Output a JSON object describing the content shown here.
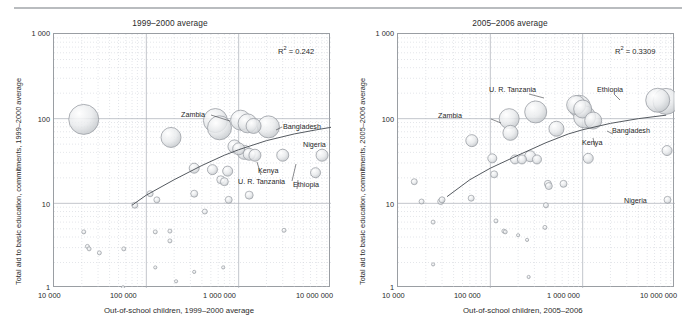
{
  "figure": {
    "top_rule_color": "#b9bcbf",
    "background": "#ffffff"
  },
  "panels": [
    {
      "id": "left",
      "title": "1999–2000 average",
      "ylabel": "Total aid to basic education, commitments, 1999–2000 average",
      "xlabel": "Out-of-school children, 1999–2000 average",
      "r2_prefix": "R",
      "r2_sup": "2",
      "r2_value": " = 0.242",
      "r2_text": "R2 = 0.242",
      "yticks": [
        "1 000",
        "100",
        "10",
        "1"
      ],
      "xticks": [
        "10 000",
        "100 000",
        "1 000 000",
        "10 000 000"
      ],
      "country_labels": [
        {
          "name": "Zambia",
          "text": "Zambia"
        },
        {
          "name": "Bangladesh",
          "text": "Bangladesh"
        },
        {
          "name": "Nigeria",
          "text": "Nigeria"
        },
        {
          "name": "Kenya",
          "text": "Kenya"
        },
        {
          "name": "U. R. Tanzania",
          "text": "U. R. Tanzania"
        },
        {
          "name": "Ethiopia",
          "text": "Ethiopia"
        }
      ]
    },
    {
      "id": "right",
      "title": "2005–2006 average",
      "ylabel": "Total aid to basic education, commitments, 2005–2006 average",
      "xlabel": "Out-of-school children, 2005–2006",
      "r2_prefix": "R",
      "r2_sup": "2",
      "r2_value": " = 0.3309",
      "r2_text": "R2 = 0.3309",
      "yticks": [
        "1 000",
        "100",
        "10",
        "1"
      ],
      "xticks": [
        "10 000",
        "100 000",
        "1 000 000",
        "10 000 000"
      ],
      "country_labels": [
        {
          "name": "U. R. Tanzania",
          "text": "U. R. Tanzania"
        },
        {
          "name": "Zambia",
          "text": "Zambia"
        },
        {
          "name": "Ethiopia",
          "text": "Ethiopia"
        },
        {
          "name": "Bangladesh",
          "text": "Bangladesh"
        },
        {
          "name": "Kenya",
          "text": "Kenya"
        },
        {
          "name": "Nigeria",
          "text": "Nigeria"
        }
      ]
    }
  ],
  "chart_data": [
    {
      "type": "scatter",
      "panel": "left",
      "title": "1999–2000 average",
      "xlabel": "Out-of-school children, 1999–2000 average",
      "ylabel": "Total aid to basic education, commitments, 1999–2000 average",
      "xscale": "log",
      "yscale": "log",
      "xlim": [
        10000,
        10000000
      ],
      "ylim": [
        1,
        1000
      ],
      "xticks": [
        10000,
        100000,
        1000000,
        10000000
      ],
      "yticks": [
        1,
        10,
        100,
        1000
      ],
      "grid": true,
      "minor_grid": true,
      "legend": "none",
      "annotations": [
        {
          "text": "R2 = 0.242",
          "x": 3000000,
          "y": 450
        }
      ],
      "trendline": {
        "kind": "log-fit",
        "x": [
          70000,
          100000,
          200000,
          400000,
          700000,
          1000000,
          2000000,
          4000000,
          7000000,
          10000000
        ],
        "y": [
          9.5,
          12.5,
          19,
          28,
          37,
          43,
          55,
          66,
          74,
          79
        ]
      },
      "bubble_size_meaning": "population / magnitude of out-of-school children (relative marker area)",
      "points": [
        {
          "label": "",
          "x": 21000,
          "y": 98,
          "size": 30
        },
        {
          "label": "",
          "x": 185000,
          "y": 60,
          "size": 20
        },
        {
          "label": "Zambia",
          "x": 560000,
          "y": 95,
          "size": 24
        },
        {
          "label": "",
          "x": 620000,
          "y": 78,
          "size": 24
        },
        {
          "label": "",
          "x": 1050000,
          "y": 96,
          "size": 20
        },
        {
          "label": "",
          "x": 1250000,
          "y": 88,
          "size": 19
        },
        {
          "label": "",
          "x": 1450000,
          "y": 82,
          "size": 15
        },
        {
          "label": "Bangladesh",
          "x": 2100000,
          "y": 80,
          "size": 22
        },
        {
          "label": "",
          "x": 900000,
          "y": 47,
          "size": 13
        },
        {
          "label": "",
          "x": 1000000,
          "y": 44,
          "size": 12
        },
        {
          "label": "",
          "x": 1150000,
          "y": 40,
          "size": 14
        },
        {
          "label": "",
          "x": 1300000,
          "y": 38,
          "size": 12
        },
        {
          "label": "Kenya",
          "x": 1500000,
          "y": 37,
          "size": 12
        },
        {
          "label": "U. R. Tanzania",
          "x": 3000000,
          "y": 37,
          "size": 12
        },
        {
          "label": "Nigeria",
          "x": 8000000,
          "y": 37,
          "size": 12
        },
        {
          "label": "Ethiopia",
          "x": 6800000,
          "y": 23,
          "size": 10
        },
        {
          "label": "",
          "x": 330000,
          "y": 26,
          "size": 10
        },
        {
          "label": "",
          "x": 520000,
          "y": 25,
          "size": 10
        },
        {
          "label": "",
          "x": 760000,
          "y": 24,
          "size": 10
        },
        {
          "label": "",
          "x": 640000,
          "y": 19,
          "size": 8
        },
        {
          "label": "",
          "x": 700000,
          "y": 18,
          "size": 8
        },
        {
          "label": "",
          "x": 780000,
          "y": 11,
          "size": 7
        },
        {
          "label": "",
          "x": 330000,
          "y": 13,
          "size": 7
        },
        {
          "label": "",
          "x": 110000,
          "y": 13,
          "size": 6
        },
        {
          "label": "",
          "x": 75000,
          "y": 9.5,
          "size": 6
        },
        {
          "label": "",
          "x": 130000,
          "y": 11,
          "size": 6
        },
        {
          "label": "",
          "x": 430000,
          "y": 8,
          "size": 5
        },
        {
          "label": "",
          "x": 1300000,
          "y": 12.5,
          "size": 8
        },
        {
          "label": "",
          "x": 21000,
          "y": 4.6,
          "size": 4
        },
        {
          "label": "",
          "x": 23000,
          "y": 3.1,
          "size": 4
        },
        {
          "label": "",
          "x": 24000,
          "y": 2.9,
          "size": 4
        },
        {
          "label": "",
          "x": 31000,
          "y": 2.6,
          "size": 4
        },
        {
          "label": "",
          "x": 57000,
          "y": 2.9,
          "size": 4
        },
        {
          "label": "",
          "x": 125000,
          "y": 4.6,
          "size": 4
        },
        {
          "label": "",
          "x": 180000,
          "y": 4.7,
          "size": 4
        },
        {
          "label": "",
          "x": 180000,
          "y": 3.6,
          "size": 4
        },
        {
          "label": "",
          "x": 3100000,
          "y": 4.8,
          "size": 4
        },
        {
          "label": "",
          "x": 125000,
          "y": 1.75,
          "size": 3
        },
        {
          "label": "",
          "x": 330000,
          "y": 1.55,
          "size": 3
        },
        {
          "label": "",
          "x": 680000,
          "y": 1.75,
          "size": 3
        },
        {
          "label": "",
          "x": 210000,
          "y": 1.2,
          "size": 2
        },
        {
          "label": "",
          "x": 56000,
          "y": 1.02,
          "size": 2
        }
      ]
    },
    {
      "type": "scatter",
      "panel": "right",
      "title": "2005–2006 average",
      "xlabel": "Out-of-school children, 2005–2006",
      "ylabel": "Total aid to basic education, commitments, 2005–2006 average",
      "xscale": "log",
      "yscale": "log",
      "xlim": [
        10000,
        10000000
      ],
      "ylim": [
        1,
        1000
      ],
      "xticks": [
        10000,
        100000,
        1000000,
        10000000
      ],
      "yticks": [
        1,
        10,
        100,
        1000
      ],
      "grid": true,
      "minor_grid": true,
      "legend": "none",
      "annotations": [
        {
          "text": "R2 = 0.3309",
          "x": 3200000,
          "y": 440
        }
      ],
      "trendline": {
        "kind": "log-fit",
        "x": [
          34000,
          60000,
          100000,
          200000,
          400000,
          700000,
          1000000,
          2000000,
          4000000,
          8000000
        ],
        "y": [
          12,
          19,
          26,
          37,
          52,
          66,
          74,
          88,
          100,
          110
        ]
      },
      "bubble_size_meaning": "population / magnitude of out-of-school children (relative marker area)",
      "points": [
        {
          "label": "",
          "x": 15000,
          "y": 18,
          "size": 6
        },
        {
          "label": "",
          "x": 18000,
          "y": 10.5,
          "size": 5
        },
        {
          "label": "",
          "x": 29000,
          "y": 10.5,
          "size": 6
        },
        {
          "label": "",
          "x": 30000,
          "y": 11,
          "size": 6
        },
        {
          "label": "Zambia",
          "x": 63000,
          "y": 55,
          "size": 12
        },
        {
          "label": "",
          "x": 62000,
          "y": 11.5,
          "size": 6
        },
        {
          "label": "",
          "x": 105000,
          "y": 34,
          "size": 9
        },
        {
          "label": "",
          "x": 110000,
          "y": 22,
          "size": 7
        },
        {
          "label": "",
          "x": 160000,
          "y": 100,
          "size": 20
        },
        {
          "label": "",
          "x": 165000,
          "y": 68,
          "size": 15
        },
        {
          "label": "",
          "x": 185000,
          "y": 33,
          "size": 9
        },
        {
          "label": "",
          "x": 220000,
          "y": 33,
          "size": 9
        },
        {
          "label": "",
          "x": 270000,
          "y": 36,
          "size": 11
        },
        {
          "label": "",
          "x": 320000,
          "y": 33,
          "size": 9
        },
        {
          "label": "U. R. Tanzania",
          "x": 310000,
          "y": 120,
          "size": 22
        },
        {
          "label": "",
          "x": 520000,
          "y": 76,
          "size": 15
        },
        {
          "label": "",
          "x": 850000,
          "y": 145,
          "size": 19
        },
        {
          "label": "",
          "x": 920000,
          "y": 140,
          "size": 22
        },
        {
          "label": "",
          "x": 1000000,
          "y": 130,
          "size": 18
        },
        {
          "label": "",
          "x": 1050000,
          "y": 105,
          "size": 22
        },
        {
          "label": "Bangladesh",
          "x": 1300000,
          "y": 95,
          "size": 17
        },
        {
          "label": "Ethiopia",
          "x": 6500000,
          "y": 165,
          "size": 24
        },
        {
          "label": "",
          "x": 8000000,
          "y": 160,
          "size": 26
        },
        {
          "label": "Kenya",
          "x": 1150000,
          "y": 34,
          "size": 10
        },
        {
          "label": "",
          "x": 8200000,
          "y": 42,
          "size": 10
        },
        {
          "label": "Nigeria",
          "x": 8300000,
          "y": 11,
          "size": 7
        },
        {
          "label": "",
          "x": 420000,
          "y": 17,
          "size": 7
        },
        {
          "label": "",
          "x": 430000,
          "y": 16,
          "size": 7
        },
        {
          "label": "",
          "x": 620000,
          "y": 17,
          "size": 7
        },
        {
          "label": "",
          "x": 400000,
          "y": 9.5,
          "size": 5
        },
        {
          "label": "",
          "x": 24000,
          "y": 6,
          "size": 4
        },
        {
          "label": "",
          "x": 115000,
          "y": 6.2,
          "size": 4
        },
        {
          "label": "",
          "x": 140000,
          "y": 4.7,
          "size": 4
        },
        {
          "label": "",
          "x": 145000,
          "y": 4.6,
          "size": 4
        },
        {
          "label": "",
          "x": 200000,
          "y": 4.2,
          "size": 3
        },
        {
          "label": "",
          "x": 250000,
          "y": 3.7,
          "size": 3
        },
        {
          "label": "",
          "x": 390000,
          "y": 5.2,
          "size": 4
        },
        {
          "label": "",
          "x": 24000,
          "y": 1.9,
          "size": 3
        },
        {
          "label": "",
          "x": 260000,
          "y": 1.35,
          "size": 2
        }
      ]
    }
  ]
}
